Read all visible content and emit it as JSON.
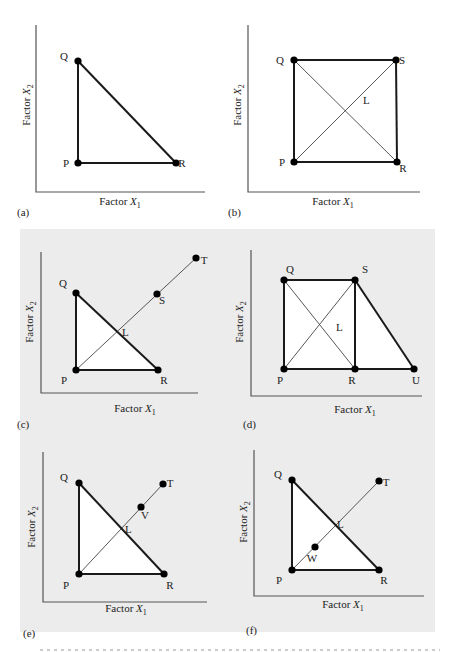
{
  "figure": {
    "background_box": {
      "x": 20,
      "y": 229,
      "width": 415,
      "height": 403,
      "color": "#ececec"
    },
    "colors": {
      "line": "#1a1a1a",
      "thin_line": "#444444",
      "point": "#000000",
      "fill": "#ffffff",
      "axis": "#555555"
    },
    "axis_labels": {
      "x": "Factor X",
      "x_sub": "1",
      "y": "Factor X",
      "y_sub": "2"
    },
    "panels": [
      {
        "tag": "(a)",
        "tag_pos": [
          17,
          216
        ],
        "axes": {
          "origin": [
            36,
            192
          ],
          "y_top": 25,
          "x_end": 205
        },
        "x_label_pos": [
          120,
          205
        ],
        "y_label_pos": [
          30,
          105
        ],
        "fill_polygon": [
          "P",
          "Q",
          "R"
        ],
        "points": {
          "P": [
            78,
            163
          ],
          "Q": [
            78,
            61
          ],
          "R": [
            176,
            163
          ]
        },
        "point_labels": {
          "P": [
            66,
            167
          ],
          "Q": [
            64,
            60
          ],
          "R": [
            182,
            167
          ]
        },
        "thick_edges": [
          [
            "P",
            "Q"
          ],
          [
            "Q",
            "R"
          ],
          [
            "P",
            "R"
          ]
        ],
        "thin_edges": [],
        "extra_labels": []
      },
      {
        "tag": "(b)",
        "tag_pos": [
          228,
          216
        ],
        "axes": {
          "origin": [
            248,
            192
          ],
          "y_top": 25,
          "x_end": 420
        },
        "x_label_pos": [
          333,
          205
        ],
        "y_label_pos": [
          241,
          105
        ],
        "fill_polygon": [
          "P",
          "Q",
          "S",
          "R"
        ],
        "points": {
          "P": [
            294,
            162
          ],
          "Q": [
            294,
            60
          ],
          "S": [
            396,
            60
          ],
          "R": [
            397,
            162
          ]
        },
        "point_labels": {
          "P": [
            282,
            166
          ],
          "Q": [
            280,
            64
          ],
          "S": [
            402,
            64
          ],
          "R": [
            403,
            172
          ]
        },
        "thick_edges": [
          [
            "P",
            "Q"
          ],
          [
            "Q",
            "S"
          ],
          [
            "S",
            "R"
          ],
          [
            "P",
            "R"
          ]
        ],
        "thin_edges": [
          [
            "P",
            "S"
          ],
          [
            "Q",
            "R"
          ]
        ],
        "extra_labels": [
          {
            "text": "L",
            "pos": [
              363,
              104
            ]
          }
        ]
      },
      {
        "tag": "(c)",
        "tag_pos": [
          17,
          428
        ],
        "axes": {
          "origin": [
            41,
            393
          ],
          "y_top": 252,
          "x_end": 198
        },
        "x_label_pos": [
          135,
          412
        ],
        "y_label_pos": [
          33,
          322
        ],
        "fill_polygon": [
          "P",
          "Q",
          "R"
        ],
        "points": {
          "P": [
            76,
            370
          ],
          "Q": [
            76,
            293
          ],
          "R": [
            158,
            370
          ],
          "S": [
            157,
            294
          ],
          "T": [
            196,
            258
          ]
        },
        "point_labels": {
          "P": [
            64,
            384
          ],
          "Q": [
            63,
            287
          ],
          "R": [
            164,
            384
          ],
          "S": [
            162,
            304
          ],
          "T": [
            204,
            264
          ]
        },
        "thick_edges": [
          [
            "P",
            "Q"
          ],
          [
            "Q",
            "R"
          ],
          [
            "P",
            "R"
          ]
        ],
        "thin_edges": [
          [
            "P",
            "T"
          ]
        ],
        "extra_labels": [
          {
            "text": "L",
            "pos": [
              122,
              336
            ]
          }
        ]
      },
      {
        "tag": "(d)",
        "tag_pos": [
          243,
          428
        ],
        "axes": {
          "origin": [
            251,
            396
          ],
          "y_top": 250,
          "x_end": 422
        },
        "x_label_pos": [
          355,
          413
        ],
        "y_label_pos": [
          243,
          322
        ],
        "fill_polygon": [
          "P",
          "Q",
          "S",
          "U"
        ],
        "points": {
          "P": [
            284,
            369
          ],
          "Q": [
            284,
            280
          ],
          "S": [
            355,
            280
          ],
          "R": [
            355,
            369
          ],
          "U": [
            414,
            369
          ]
        },
        "point_labels": {
          "P": [
            280,
            384
          ],
          "Q": [
            290,
            273
          ],
          "S": [
            365,
            273
          ],
          "R": [
            352,
            384
          ],
          "U": [
            416,
            384
          ]
        },
        "thick_edges": [
          [
            "P",
            "Q"
          ],
          [
            "Q",
            "S"
          ],
          [
            "S",
            "R"
          ],
          [
            "P",
            "U"
          ],
          [
            "S",
            "U"
          ]
        ],
        "thin_edges": [
          [
            "P",
            "S"
          ],
          [
            "Q",
            "R"
          ]
        ],
        "extra_labels": [
          {
            "text": "L",
            "pos": [
              336,
              331
            ]
          }
        ]
      },
      {
        "tag": "(e)",
        "tag_pos": [
          23,
          637
        ],
        "axes": {
          "origin": [
            43,
            602
          ],
          "y_top": 452,
          "x_end": 207
        },
        "x_label_pos": [
          126,
          612
        ],
        "y_label_pos": [
          35,
          527
        ],
        "fill_polygon": [
          "P",
          "Q",
          "R"
        ],
        "points": {
          "P": [
            79,
            574
          ],
          "Q": [
            79,
            483
          ],
          "R": [
            164,
            574
          ],
          "V": [
            141,
            507
          ],
          "T": [
            163,
            484
          ]
        },
        "point_labels": {
          "P": [
            66,
            589
          ],
          "Q": [
            64,
            481
          ],
          "R": [
            170,
            589
          ],
          "V": [
            145,
            519
          ],
          "T": [
            170,
            487
          ]
        },
        "thick_edges": [
          [
            "P",
            "Q"
          ],
          [
            "Q",
            "R"
          ],
          [
            "P",
            "R"
          ]
        ],
        "thin_edges": [
          [
            "P",
            "T"
          ]
        ],
        "extra_labels": [
          {
            "text": "L",
            "pos": [
              125,
              533
            ]
          }
        ]
      },
      {
        "tag": "(f)",
        "tag_pos": [
          246,
          634
        ],
        "axes": {
          "origin": [
            254,
            596
          ],
          "y_top": 450,
          "x_end": 424
        },
        "x_label_pos": [
          343,
          608
        ],
        "y_label_pos": [
          247,
          522
        ],
        "fill_polygon": [
          "P",
          "Q",
          "R"
        ],
        "points": {
          "P": [
            292,
            570
          ],
          "Q": [
            292,
            480
          ],
          "R": [
            379,
            570
          ],
          "W": [
            315,
            547
          ],
          "T": [
            379,
            481
          ]
        },
        "point_labels": {
          "P": [
            279,
            584
          ],
          "Q": [
            278,
            478
          ],
          "R": [
            384,
            584
          ],
          "W": [
            312,
            562
          ],
          "T": [
            386,
            486
          ]
        },
        "thick_edges": [
          [
            "P",
            "Q"
          ],
          [
            "Q",
            "R"
          ],
          [
            "P",
            "R"
          ]
        ],
        "thin_edges": [
          [
            "P",
            "T"
          ]
        ],
        "extra_labels": [
          {
            "text": "L",
            "pos": [
              337,
              528
            ]
          }
        ]
      }
    ]
  }
}
